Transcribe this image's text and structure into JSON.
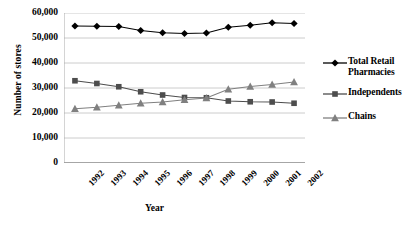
{
  "chart_data": {
    "type": "line",
    "title": "",
    "xlabel": "Year",
    "ylabel": "Number of stores",
    "categories": [
      "1992",
      "1993",
      "1994",
      "1995",
      "1996",
      "1997",
      "1998",
      "1999",
      "2000",
      "2001",
      "2002"
    ],
    "x": [
      1992,
      1993,
      1994,
      1995,
      1996,
      1997,
      1998,
      1999,
      2000,
      2001,
      2002
    ],
    "ylim": [
      0,
      60000
    ],
    "yticks": [
      0,
      10000,
      20000,
      30000,
      40000,
      50000,
      60000
    ],
    "ytick_labels": [
      "0",
      "10,000",
      "20,000",
      "30,000",
      "40,000",
      "50,000",
      "60,000"
    ],
    "grid": true,
    "grid_axis": "y",
    "legend_position": "right",
    "series": [
      {
        "name": "Total Retail Pharmacies",
        "marker": "diamond",
        "color": "#000000",
        "values": [
          54800,
          54700,
          54600,
          53000,
          52100,
          51800,
          52000,
          54300,
          55100,
          56100,
          55800
        ]
      },
      {
        "name": "Independents",
        "marker": "square",
        "color": "#4d4d4d",
        "values": [
          32900,
          31800,
          30500,
          28500,
          27200,
          26200,
          26100,
          24800,
          24500,
          24400,
          23900
        ]
      },
      {
        "name": "Chains",
        "marker": "triangle",
        "color": "#808080",
        "values": [
          21700,
          22300,
          23100,
          23900,
          24400,
          25300,
          26000,
          29500,
          30600,
          31400,
          32400
        ]
      }
    ]
  },
  "axis": {
    "y_title": "Number of stores",
    "x_title": "Year"
  },
  "legend": {
    "items": [
      {
        "label_line1": "Total Retail",
        "label_line2": "Pharmacies",
        "marker": "diamond-line-marker",
        "color": "#000000"
      },
      {
        "label_line1": "Independents",
        "label_line2": "",
        "marker": "square-line-marker",
        "color": "#4d4d4d"
      },
      {
        "label_line1": "Chains",
        "label_line2": "",
        "marker": "triangle-line-marker",
        "color": "#808080"
      }
    ]
  },
  "caption": {
    "text": ""
  }
}
